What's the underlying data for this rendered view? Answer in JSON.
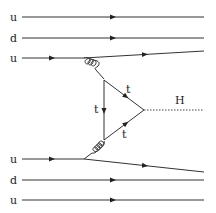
{
  "diagram": {
    "type": "feynman",
    "upper_proton": {
      "quarks": [
        {
          "label": "u",
          "y": 17
        },
        {
          "label": "d",
          "y": 38
        },
        {
          "label": "u",
          "y": 58
        }
      ]
    },
    "lower_proton": {
      "quarks": [
        {
          "label": "u",
          "y": 159
        },
        {
          "label": "d",
          "y": 180
        },
        {
          "label": "u",
          "y": 200
        }
      ]
    },
    "loop": {
      "labels": [
        "t",
        "t",
        "t"
      ],
      "top_label": "t",
      "left_label": "t",
      "bottom_label": "t"
    },
    "higgs": {
      "label": "H"
    },
    "gluon_label": "g"
  }
}
